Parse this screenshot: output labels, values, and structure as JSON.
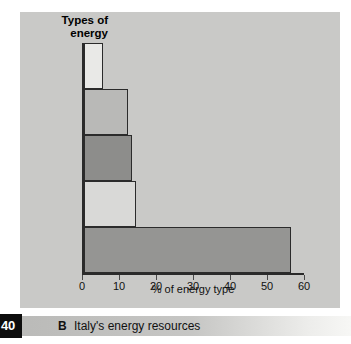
{
  "figure": {
    "title": "Types of\nenergy",
    "panel_color": "#c9c9c7",
    "axis_color": "#2a2a2a"
  },
  "caption": {
    "page_number": "40",
    "letter": "B",
    "text": "Italy's energy resources"
  },
  "chart_data": {
    "type": "bar",
    "orientation": "horizontal",
    "title": "Types of energy",
    "xlabel": "% of energy type",
    "ylabel": "",
    "categories": [
      "Nuclear and\ngeothermal",
      "Natural gas",
      "Hydroelectric\npower",
      "Coal",
      "Petroleum"
    ],
    "values": [
      5,
      12,
      13,
      14,
      56
    ],
    "bar_colors": [
      "#e9e9e7",
      "#b9b9b7",
      "#8d8d8b",
      "#d9d9d7",
      "#959593"
    ],
    "xlim": [
      0,
      60
    ],
    "xticks": [
      0,
      10,
      20,
      30,
      40,
      50,
      60
    ],
    "xtick_labels": [
      "0",
      "10",
      "20",
      "30",
      "40",
      "50",
      "60"
    ],
    "grid": false,
    "legend": false
  }
}
